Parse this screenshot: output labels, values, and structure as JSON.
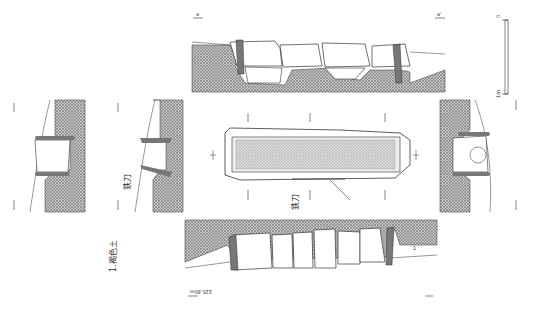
{
  "figure": {
    "type": "archaeological stone coffin excavation drawing",
    "colors": {
      "hatch": "#8a8a8a",
      "line": "#333333",
      "stone_slab": "#777777",
      "background": "#ffffff"
    }
  },
  "legend": {
    "soil_1": "1.褐色土"
  },
  "labels": {
    "iron_sword": "鉄刀",
    "iron_sword_section": "鉄刀",
    "elevation": "225.80m",
    "layer": "1"
  },
  "section_markers": {
    "top_left": "a",
    "top_right": "a'",
    "bottom_left": "b",
    "bottom_right": "b'",
    "left_top": "c",
    "left_bottom": "c'",
    "mid_left_top": "d",
    "mid_left_bottom": "d'",
    "right_top": "e",
    "right_bottom": "e'",
    "plan_left": "b",
    "plan_right": "b'"
  },
  "scale_bar": {
    "top": "0",
    "bottom": "1m"
  }
}
